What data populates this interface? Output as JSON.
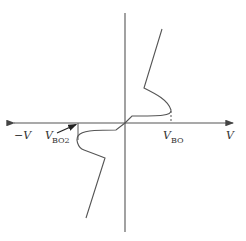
{
  "diagram": {
    "title": "",
    "type": "I-V characteristic (bidirectional breakover device)",
    "axes": {
      "x_positive_label": "V",
      "x_negative_label": "−V"
    },
    "labels": {
      "vbo_main": "V",
      "vbo_sub": "BO",
      "vbo2_main": "V",
      "vbo2_sub": "BO2"
    },
    "colors": {
      "stroke": "#555555",
      "text": "#333333",
      "background": "#ffffff"
    }
  }
}
